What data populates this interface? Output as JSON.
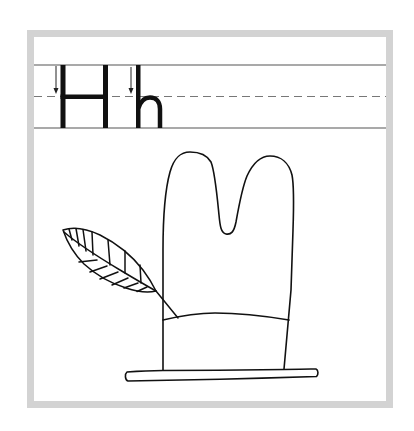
{
  "worksheet": {
    "title": "Letter Hh handwriting practice",
    "letters": {
      "uppercase": "H",
      "lowercase": "h"
    },
    "guidelines": {
      "top": "solid",
      "midline": "dashed",
      "baseline": "solid"
    },
    "stroke_arrows": [
      {
        "letter": "H",
        "direction": "down"
      },
      {
        "letter": "h",
        "direction": "down"
      }
    ],
    "illustration": {
      "subject": "hat with feather",
      "parts": [
        "hat-crown",
        "hat-band",
        "hat-brim",
        "feather"
      ]
    }
  },
  "colors": {
    "frame_border": "#d3d3d3",
    "ink": "#111111",
    "guideline": "#555555",
    "dashed_guideline": "#777777",
    "background": "#ffffff"
  }
}
